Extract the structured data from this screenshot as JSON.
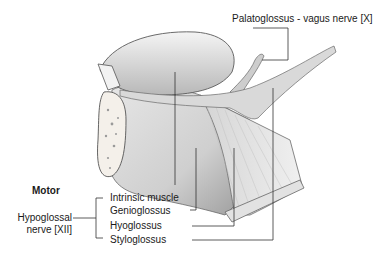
{
  "diagram": {
    "labels": {
      "palatoglossus": "Palatoglossus - vagus nerve [X]",
      "motor": "Motor",
      "hypoglossal_line1": "Hypoglossal",
      "hypoglossal_line2": "nerve [XII]",
      "intrinsic": "Intrinsic muscle",
      "genioglossus": "Genioglossus",
      "hyoglossus": "Hyoglossus",
      "styloglossus": "Styloglossus"
    },
    "colors": {
      "muscle_light": "#e8e8e8",
      "muscle_mid": "#c8c8c8",
      "muscle_dark": "#8a8a8a",
      "outline": "#555555",
      "leader": "#333333",
      "bone": "#f4f0ea"
    }
  }
}
